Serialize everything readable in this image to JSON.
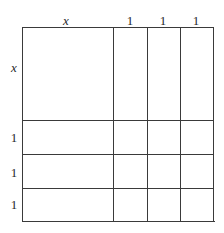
{
  "diagram": {
    "type": "algebra-tile-area-model",
    "top_labels": [
      {
        "text": "x",
        "italic": true
      },
      {
        "text": "1",
        "italic": false
      },
      {
        "text": "1",
        "italic": false
      },
      {
        "text": "1",
        "italic": false
      }
    ],
    "left_labels": [
      {
        "text": "x",
        "italic": true
      },
      {
        "text": "1",
        "italic": false
      },
      {
        "text": "1",
        "italic": false
      },
      {
        "text": "1",
        "italic": false
      }
    ],
    "line_color": "#3a3a3a",
    "background": "#ffffff"
  }
}
